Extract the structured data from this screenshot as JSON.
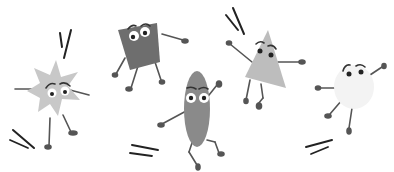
{
  "scene": {
    "description": "Five cartoon geometric shape characters with arms, legs and eyes jumping",
    "background": "#ffffff",
    "characters": [
      {
        "shape": "star",
        "fill": "#c8c8c8"
      },
      {
        "shape": "square",
        "fill": "#6e6e6e"
      },
      {
        "shape": "oval",
        "fill": "#8a8a8a"
      },
      {
        "shape": "triangle",
        "fill": "#bdbdbd"
      },
      {
        "shape": "cloud",
        "fill": "#f3f3f3"
      }
    ],
    "colors": {
      "limb": "#555555",
      "eye_white": "#ffffff",
      "pupil": "#222222",
      "motion_line": "#333333"
    }
  }
}
